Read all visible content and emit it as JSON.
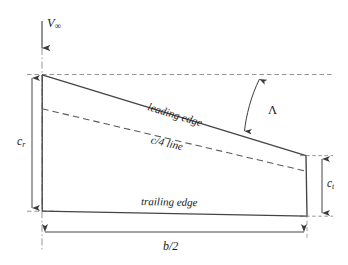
{
  "figure": {
    "kind": "wing-planform-diagram",
    "background_color": "#ffffff",
    "line_color": "#4a4a4a",
    "text_color": "#1b1b1b"
  },
  "labels": {
    "freestream_velocity": "V",
    "freestream_subscript": "∞",
    "root_chord": "c",
    "root_chord_subscript": "r",
    "tip_chord": "c",
    "tip_chord_subscript": "t",
    "semispan": "b/2",
    "sweep_angle": "Λ",
    "leading_edge": "leading edge",
    "quarter_chord_line": "c/4 line",
    "trailing_edge": "trailing edge"
  },
  "geometry": {
    "centerline": {
      "x": 42,
      "y1": 48,
      "y2": 252,
      "style": "dash-dot"
    },
    "freestream_arrow": {
      "x": 42,
      "y1": 21,
      "y2": 49,
      "direction": "down"
    },
    "reference_line_top": {
      "y": 74,
      "x1": 27,
      "x2": 332,
      "style": "dashed"
    },
    "reference_line_bottom": {
      "y": 211,
      "x1": 27,
      "x2": 332,
      "style": "dashed"
    },
    "reference_line_tip_top": {
      "y": 156,
      "x1": 300,
      "x2": 332,
      "style": "dashed"
    },
    "wing_outline": {
      "root_leading_edge": {
        "x": 42,
        "y": 75
      },
      "tip_leading_edge": {
        "x": 306,
        "y": 156
      },
      "tip_trailing_edge": {
        "x": 307,
        "y": 216
      },
      "root_trailing_edge": {
        "x": 42,
        "y": 211
      }
    },
    "quarter_chord": {
      "root": {
        "x": 42,
        "y": 109
      },
      "tip": {
        "x": 306,
        "y": 171
      },
      "style": "dashed"
    },
    "dimension_root_chord": {
      "x": 32,
      "y1": 75,
      "y2": 211,
      "arrows": "both"
    },
    "dimension_tip_chord": {
      "x": 322,
      "y1": 156,
      "y2": 216,
      "arrows": "both"
    },
    "dimension_semispan": {
      "y": 232,
      "x1": 42,
      "x2": 307,
      "arrows": "both"
    },
    "sweep_arc": {
      "from": {
        "x": 259,
        "y": 77
      },
      "to": {
        "x": 243,
        "y": 134
      },
      "arrows": "both"
    },
    "tip_extension_line": {
      "x1": 306,
      "y1": 156,
      "x2": 307,
      "y2": 216
    },
    "vertical_tick_tip": {
      "x": 307,
      "y1": 216,
      "y2": 236
    }
  }
}
